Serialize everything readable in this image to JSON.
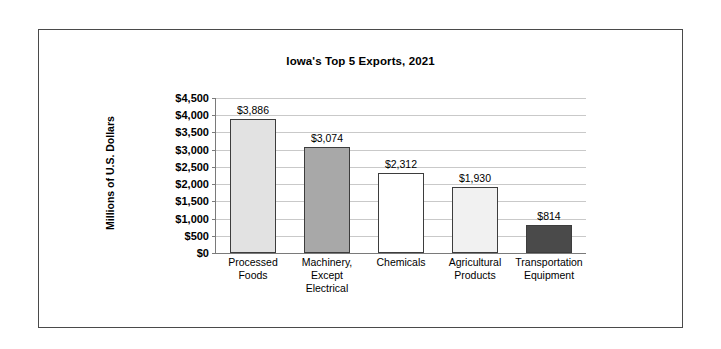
{
  "chart_data": {
    "type": "bar",
    "title": "Iowa's Top 5 Exports, 2021",
    "xlabel": "",
    "ylabel": "Millions of U.S. Dollars",
    "categories": [
      "Processed Foods",
      "Machinery, Except Electrical",
      "Chemicals",
      "Agricultural Products",
      "Transportation Equipment"
    ],
    "category_lines": [
      [
        "Processed",
        "Foods"
      ],
      [
        "Machinery,",
        "Except",
        "Electrical"
      ],
      [
        "Chemicals"
      ],
      [
        "Agricultural",
        "Products"
      ],
      [
        "Transportation",
        "Equipment"
      ]
    ],
    "values": [
      3886,
      3074,
      2312,
      1930,
      814
    ],
    "value_labels": [
      "$3,886",
      "$3,074",
      "$2,312",
      "$1,930",
      "$814"
    ],
    "ylim": [
      0,
      4500
    ],
    "ytick_values": [
      0,
      500,
      1000,
      1500,
      2000,
      2500,
      3000,
      3500,
      4000,
      4500
    ],
    "ytick_labels": [
      "$0",
      "$500",
      "$1,000",
      "$1,500",
      "$2,000",
      "$2,500",
      "$3,000",
      "$3,500",
      "$4,000",
      "$4,500"
    ],
    "grid": true,
    "legend": "none",
    "bar_colors": [
      "#e2e2e2",
      "#a8a8a8",
      "#ffffff",
      "#f1f1f1",
      "#4a4a4a"
    ],
    "bar_border_color": "#3d3d3d",
    "gridline_color": "#c9c9c9",
    "axis_color": "#7a7a7a",
    "frame_color": "#4a4a4a",
    "text_color": "#000000",
    "background": "#ffffff"
  }
}
